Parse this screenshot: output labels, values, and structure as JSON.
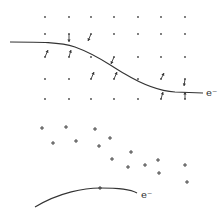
{
  "diagram": {
    "colors": {
      "ink": "#333333",
      "dot": "#444444",
      "background": "#ffffff"
    },
    "top_panel": {
      "label": "e⁻",
      "label_pos": [
        206,
        96
      ],
      "lattice_rows": [
        17,
        34,
        57,
        79,
        99
      ],
      "lattice_cols": [
        45,
        69,
        91,
        114,
        138,
        161,
        185
      ],
      "path": "M10,42 C40,42 60,42 75,47 C100,56 110,66 125,74 C145,86 160,91 175,92 L203,93",
      "displaced_ions": [
        {
          "from": [
            69,
            34
          ],
          "to": [
            69,
            42
          ]
        },
        {
          "from": [
            91,
            34
          ],
          "to": [
            88,
            41
          ]
        },
        {
          "from": [
            45,
            57
          ],
          "to": [
            48,
            50
          ]
        },
        {
          "from": [
            69,
            57
          ],
          "to": [
            71,
            50
          ]
        },
        {
          "from": [
            91,
            79
          ],
          "to": [
            94,
            72
          ]
        },
        {
          "from": [
            114,
            57
          ],
          "to": [
            111,
            64
          ]
        },
        {
          "from": [
            114,
            79
          ],
          "to": [
            117,
            72
          ]
        },
        {
          "from": [
            161,
            79
          ],
          "to": [
            164,
            73
          ]
        },
        {
          "from": [
            185,
            79
          ],
          "to": [
            184,
            86
          ]
        },
        {
          "from": [
            161,
            99
          ],
          "to": [
            163,
            92
          ]
        },
        {
          "from": [
            185,
            99
          ],
          "to": [
            185,
            92
          ]
        }
      ]
    },
    "bottom_panel": {
      "label": "e⁻",
      "label_pos": [
        141,
        198
      ],
      "path": "M35,207 C60,192 85,188 100,188 C120,188 130,189 137,193",
      "positive_ions": [
        [
          42,
          128
        ],
        [
          66,
          127
        ],
        [
          95,
          129
        ],
        [
          53,
          143
        ],
        [
          76,
          141
        ],
        [
          110,
          138
        ],
        [
          99,
          146
        ],
        [
          131,
          152
        ],
        [
          112,
          159
        ],
        [
          128,
          167
        ],
        [
          145,
          165
        ],
        [
          158,
          160
        ],
        [
          159,
          173
        ],
        [
          185,
          165
        ],
        [
          187,
          182
        ],
        [
          100,
          188
        ]
      ]
    }
  }
}
